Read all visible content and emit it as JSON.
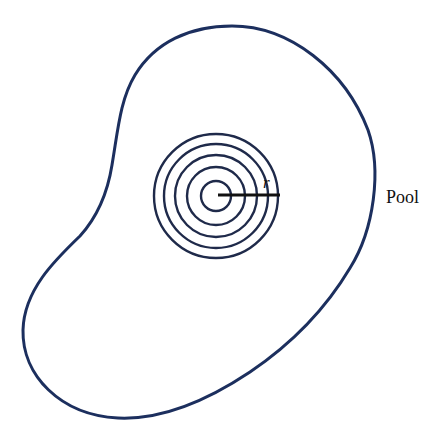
{
  "diagram": {
    "type": "ripples-in-pool",
    "pool": {
      "label": "Pool",
      "outline_color": "#1c2f5e",
      "outline_width": 3
    },
    "ripples": {
      "center": [
        216,
        196
      ],
      "radii": [
        15,
        29,
        41,
        52,
        62
      ],
      "color": "#1f2a4a",
      "stroke_width": 2.4
    },
    "radius_marker": {
      "label": "r",
      "from": [
        218,
        195
      ],
      "to": [
        280,
        195
      ],
      "color": "#111111",
      "stroke_width": 3.2
    }
  }
}
